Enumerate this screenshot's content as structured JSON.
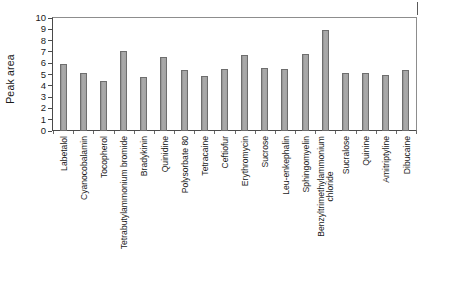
{
  "chart_data": {
    "type": "bar",
    "title": "",
    "xlabel": "",
    "ylabel": "Peak area",
    "ylim": [
      0,
      10
    ],
    "ytick_step": 1,
    "yticks": [
      "10",
      "9",
      "8",
      "7",
      "6",
      "5",
      "4",
      "3",
      "2",
      "1",
      "0"
    ],
    "grid": false,
    "legend": null,
    "bar_color": "#a2a2a2",
    "bar_edge_color": "#6e6e6e",
    "axis_color": "#4a4a4a",
    "categories": [
      "Labetalol",
      "Cyanocobalamin",
      "Tocopherol",
      "Tetrabutylammonium bromide",
      "Bradykinin",
      "Quinidine",
      "Polysorbate 80",
      "Tetracaine",
      "Ceftiofur",
      "Erythromycin",
      "Sucrose",
      "Leu-enkephalin",
      "Sphingomyelin",
      "Benzyltrimethylammonium chloride",
      "Sucralose",
      "Quinine",
      "Amitriptyline",
      "Dibucaine"
    ],
    "category_lines": [
      [
        "Labetalol"
      ],
      [
        "Cyanocobalamin"
      ],
      [
        "Tocopherol"
      ],
      [
        "Tetrabutylammonium bromide"
      ],
      [
        "Bradykinin"
      ],
      [
        "Quinidine"
      ],
      [
        "Polysorbate 80"
      ],
      [
        "Tetracaine"
      ],
      [
        "Ceftiofur"
      ],
      [
        "Erythromycin"
      ],
      [
        "Sucrose"
      ],
      [
        "Leu-enkephalin"
      ],
      [
        "Sphingomyelin"
      ],
      [
        "Benzyltrimethylammonium",
        "chloride"
      ],
      [
        "Sucralose"
      ],
      [
        "Quinine"
      ],
      [
        "Amitriptyline"
      ],
      [
        "Dibucaine"
      ]
    ],
    "values": [
      5.9,
      5.1,
      4.45,
      7.1,
      4.8,
      6.55,
      5.4,
      4.85,
      5.5,
      6.75,
      5.6,
      5.5,
      6.8,
      8.9,
      5.15,
      5.1,
      5.0,
      5.4
    ]
  }
}
